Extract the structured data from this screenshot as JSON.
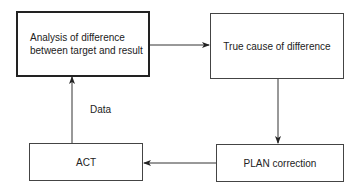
{
  "diagram": {
    "type": "flowchart",
    "nodes": [
      {
        "id": "analysis",
        "label_line1": "Analysis of difference",
        "label_line2": "between target and result"
      },
      {
        "id": "true_cause",
        "label": "True cause of difference"
      },
      {
        "id": "plan",
        "label": "PLAN correction"
      },
      {
        "id": "act",
        "label": "ACT"
      }
    ],
    "edges": [
      {
        "from": "analysis",
        "to": "true_cause"
      },
      {
        "from": "true_cause",
        "to": "plan"
      },
      {
        "from": "plan",
        "to": "act"
      },
      {
        "from": "act",
        "to": "analysis",
        "label": "Data"
      }
    ],
    "edge_label_data": "Data"
  }
}
